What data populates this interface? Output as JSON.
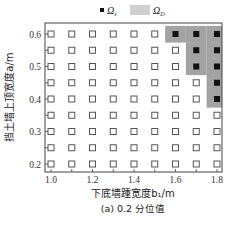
{
  "chart_data": {
    "type": "scatter",
    "title": "",
    "caption": "(a) 0.2 分位值",
    "xlabel": "下底墙踵宽度b₁/m",
    "ylabel": "挡土墙上顶宽度a/m",
    "xlim": [
      0.97,
      1.83
    ],
    "ylim": [
      0.18,
      0.62
    ],
    "xticks": [
      1.0,
      1.2,
      1.4,
      1.6,
      1.8
    ],
    "xtick_labels": [
      "1.0",
      "1.2",
      "1.4",
      "1.6",
      "1.8"
    ],
    "yticks": [
      0.2,
      0.3,
      0.4,
      0.5,
      0.6
    ],
    "ytick_labels": [
      "0.2",
      "0.3",
      "0.4",
      "0.5",
      "0.6"
    ],
    "x_grid_values": [
      1.0,
      1.1,
      1.2,
      1.3,
      1.4,
      1.5,
      1.6,
      1.7,
      1.8
    ],
    "y_grid_values": [
      0.2,
      0.25,
      0.3,
      0.35,
      0.4,
      0.45,
      0.5,
      0.55,
      0.6
    ],
    "legend": [
      {
        "label": "Ω_s",
        "marker": "filled-square",
        "color": "#111111"
      },
      {
        "label": "Ω_D",
        "marker": "shaded-region",
        "color": "#a6a6a6"
      }
    ],
    "legend_position": "top",
    "grid": false,
    "series": [
      {
        "name": "Ω_s",
        "marker": "filled-square",
        "points": [
          [
            1.6,
            0.6
          ],
          [
            1.7,
            0.6
          ],
          [
            1.8,
            0.6
          ],
          [
            1.7,
            0.55
          ],
          [
            1.8,
            0.55
          ],
          [
            1.7,
            0.5
          ],
          [
            1.8,
            0.5
          ],
          [
            1.8,
            0.45
          ],
          [
            1.8,
            0.4
          ]
        ]
      },
      {
        "name": "other",
        "marker": "open-square",
        "points": "all remaining grid points"
      }
    ],
    "shaded_region_cells": [
      [
        1.6,
        0.6
      ],
      [
        1.7,
        0.6
      ],
      [
        1.8,
        0.6
      ],
      [
        1.7,
        0.55
      ],
      [
        1.8,
        0.55
      ],
      [
        1.7,
        0.5
      ],
      [
        1.8,
        0.5
      ],
      [
        1.8,
        0.45
      ],
      [
        1.8,
        0.4
      ]
    ]
  },
  "colors": {
    "shade": "#a3a3a3",
    "filled_marker": "#111111",
    "open_marker": "#555555",
    "axis": "#444444"
  }
}
